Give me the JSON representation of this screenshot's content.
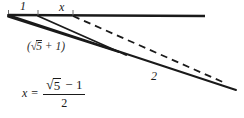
{
  "figure": {
    "kind": "geometry-diagram",
    "title_text": "",
    "background_color": "#ffffff",
    "stroke_color": "#1a1a1a",
    "labels": {
      "segment_one": "1",
      "segment_x": "x",
      "segment_two": "2",
      "sqrt_expression_open": "(",
      "sqrt_expression_radical": "√",
      "sqrt_expression_radicand": "5",
      "sqrt_expression_plus": "+ 1",
      "sqrt_expression_close": ")"
    },
    "formula": {
      "variable": "x",
      "equals": "=",
      "numerator_radical": "√",
      "numerator_radicand": "5",
      "numerator_rest": "− 1",
      "denominator": "2"
    },
    "strokes": [
      {
        "name": "horizontal-baseline",
        "style": "solid",
        "width": 2.2,
        "points": [
          [
            8,
            15
          ],
          [
            205,
            16
          ]
        ]
      },
      {
        "name": "ray-outer-solid",
        "style": "solid",
        "width": 1.8,
        "points": [
          [
            8,
            15
          ],
          [
            236,
            90
          ]
        ]
      },
      {
        "name": "ray-inner-solid",
        "style": "solid",
        "width": 1.8,
        "points": [
          [
            8,
            16
          ],
          [
            118,
            52
          ]
        ]
      },
      {
        "name": "ray-middle-solid",
        "style": "solid",
        "width": 1.8,
        "points": [
          [
            38,
            16
          ],
          [
            124,
            54
          ]
        ]
      },
      {
        "name": "ray-dashed",
        "style": "dashed",
        "width": 1.8,
        "dash": "7 5",
        "points": [
          [
            73,
            16
          ],
          [
            224,
            82
          ]
        ]
      }
    ],
    "ticks": [
      {
        "name": "tick-origin",
        "x": 8,
        "y_top": 11,
        "y_bottom": 16
      },
      {
        "name": "tick-one-end",
        "x": 38,
        "y_top": 11,
        "y_bottom": 16
      },
      {
        "name": "tick-x-end",
        "x": 73,
        "y_top": 11,
        "y_bottom": 16
      }
    ]
  }
}
